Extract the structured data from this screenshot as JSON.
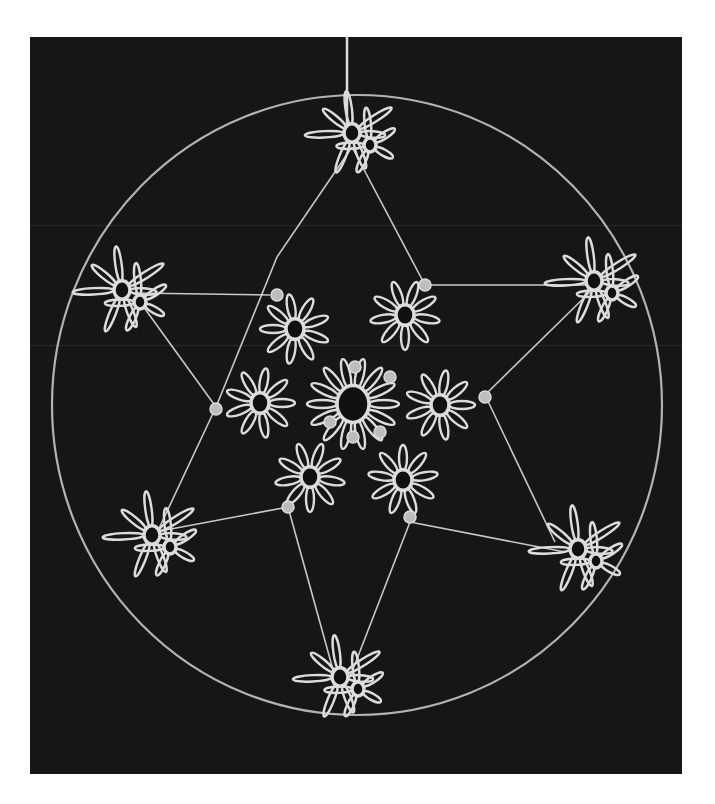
{
  "image": {
    "subject": "tatted lace star snowflake ornament in a circular ring",
    "background_color": "#161616",
    "thread_color": "#dcdcdc",
    "ring_color": "#cfcfcf",
    "frame": {
      "x": 30,
      "y": 37,
      "width": 652,
      "height": 737
    }
  },
  "ring": {
    "cx": 327,
    "cy": 368,
    "rx": 305,
    "ry": 310
  },
  "hanging_thread": {
    "x": 317,
    "y1": 0,
    "y2": 95
  },
  "center_motif": {
    "cx": 323,
    "cy": 367,
    "ring_r": 16,
    "petals": 14,
    "petal_len": 30
  },
  "inner_motifs": [
    {
      "cx": 265,
      "cy": 292,
      "petals": 9,
      "len": 26,
      "rot": -20
    },
    {
      "cx": 375,
      "cy": 278,
      "petals": 9,
      "len": 26,
      "rot": 10
    },
    {
      "cx": 230,
      "cy": 366,
      "petals": 9,
      "len": 26,
      "rot": 0
    },
    {
      "cx": 410,
      "cy": 368,
      "petals": 9,
      "len": 26,
      "rot": 0
    },
    {
      "cx": 280,
      "cy": 440,
      "petals": 9,
      "len": 26,
      "rot": 10
    },
    {
      "cx": 373,
      "cy": 443,
      "petals": 9,
      "len": 26,
      "rot": -10
    }
  ],
  "star_points": [
    {
      "name": "top",
      "cx": 322,
      "cy": 96,
      "len": 36
    },
    {
      "name": "upper-left",
      "cx": 92,
      "cy": 253,
      "len": 38
    },
    {
      "name": "upper-right",
      "cx": 564,
      "cy": 244,
      "len": 38
    },
    {
      "name": "lower-left",
      "cx": 122,
      "cy": 498,
      "len": 38
    },
    {
      "name": "lower-right",
      "cx": 548,
      "cy": 512,
      "len": 38
    },
    {
      "name": "bottom",
      "cx": 310,
      "cy": 640,
      "len": 36
    }
  ],
  "star_lines": [
    [
      322,
      110,
      247,
      220
    ],
    [
      322,
      110,
      395,
      248
    ],
    [
      105,
      256,
      240,
      258
    ],
    [
      395,
      248,
      560,
      248
    ],
    [
      247,
      220,
      186,
      370
    ],
    [
      560,
      255,
      455,
      358
    ],
    [
      186,
      370,
      125,
      500
    ],
    [
      455,
      358,
      525,
      505
    ],
    [
      125,
      495,
      258,
      470
    ],
    [
      380,
      485,
      535,
      515
    ],
    [
      258,
      470,
      305,
      640
    ],
    [
      380,
      485,
      320,
      640
    ],
    [
      110,
      265,
      186,
      370
    ]
  ],
  "knots": [
    [
      247,
      258
    ],
    [
      395,
      248
    ],
    [
      186,
      372
    ],
    [
      455,
      360
    ],
    [
      258,
      470
    ],
    [
      380,
      480
    ],
    [
      325,
      330
    ],
    [
      360,
      340
    ],
    [
      300,
      385
    ],
    [
      350,
      395
    ],
    [
      323,
      400
    ]
  ]
}
